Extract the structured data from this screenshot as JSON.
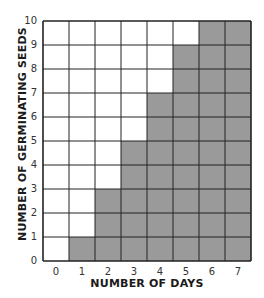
{
  "chart_data": {
    "type": "bar",
    "title": "",
    "xlabel": "NUMBER OF DAYS",
    "ylabel": "NUMBER OF GERMINATING SEEDS",
    "categories": [
      "0",
      "1",
      "2",
      "3",
      "4",
      "5",
      "6",
      "7"
    ],
    "values": [
      0,
      1,
      3,
      5,
      7,
      9,
      10,
      10
    ],
    "xticks": [
      "0",
      "1",
      "2",
      "3",
      "4",
      "5",
      "6",
      "7"
    ],
    "yticks": [
      "0",
      "1",
      "2",
      "3",
      "4",
      "5",
      "6",
      "7",
      "8",
      "9",
      "10"
    ],
    "ylim": [
      0,
      10
    ],
    "grid": true,
    "legend": null,
    "style": "shaded grid cells (staircase)"
  },
  "colors": {
    "fill": "#9a9a9a",
    "grid_line": "#222222",
    "background": "#ffffff"
  },
  "labels": {
    "xlabel": "NUMBER OF DAYS",
    "ylabel": "NUMBER OF GERMINATING SEEDS"
  }
}
